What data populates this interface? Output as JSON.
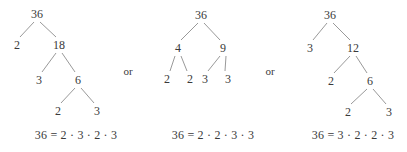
{
  "figure": {
    "subject": "36",
    "separator_label": "or",
    "separators": [
      {
        "label": "or",
        "x": 128,
        "y": 71
      },
      {
        "label": "or",
        "x": 270,
        "y": 71
      }
    ],
    "trees": [
      {
        "id": "factor-tree-1",
        "nodes": [
          {
            "id": "t1-root",
            "label": "36",
            "x": 37,
            "y": 14
          },
          {
            "id": "t1-l1a",
            "label": "2",
            "x": 17,
            "y": 45
          },
          {
            "id": "t1-l1b",
            "label": "18",
            "x": 59,
            "y": 45
          },
          {
            "id": "t1-l2a",
            "label": "3",
            "x": 39,
            "y": 80
          },
          {
            "id": "t1-l2b",
            "label": "6",
            "x": 78,
            "y": 80
          },
          {
            "id": "t1-l3a",
            "label": "2",
            "x": 58,
            "y": 111
          },
          {
            "id": "t1-l3b",
            "label": "3",
            "x": 97,
            "y": 111
          }
        ],
        "edges": [
          {
            "from": "t1-root",
            "to": "t1-l1a"
          },
          {
            "from": "t1-root",
            "to": "t1-l1b"
          },
          {
            "from": "t1-l1b",
            "to": "t1-l2a"
          },
          {
            "from": "t1-l1b",
            "to": "t1-l2b"
          },
          {
            "from": "t1-l2b",
            "to": "t1-l3a"
          },
          {
            "from": "t1-l2b",
            "to": "t1-l3b"
          }
        ],
        "equation": {
          "text": "36 = 2 · 3 · 2 · 3",
          "x": 76,
          "y": 135
        }
      },
      {
        "id": "factor-tree-2",
        "nodes": [
          {
            "id": "t2-root",
            "label": "36",
            "x": 201,
            "y": 15
          },
          {
            "id": "t2-l1a",
            "label": "4",
            "x": 178,
            "y": 48
          },
          {
            "id": "t2-l1b",
            "label": "9",
            "x": 223,
            "y": 48
          },
          {
            "id": "t2-l2a",
            "label": "2",
            "x": 167,
            "y": 79
          },
          {
            "id": "t2-l2b",
            "label": "2",
            "x": 190,
            "y": 79
          },
          {
            "id": "t2-l2c",
            "label": "3",
            "x": 205,
            "y": 79
          },
          {
            "id": "t2-l2d",
            "label": "3",
            "x": 228,
            "y": 79
          }
        ],
        "edges": [
          {
            "from": "t2-root",
            "to": "t2-l1a"
          },
          {
            "from": "t2-root",
            "to": "t2-l1b"
          },
          {
            "from": "t2-l1a",
            "to": "t2-l2a"
          },
          {
            "from": "t2-l1a",
            "to": "t2-l2b"
          },
          {
            "from": "t2-l1b",
            "to": "t2-l2c"
          },
          {
            "from": "t2-l1b",
            "to": "t2-l2d"
          }
        ],
        "equation": {
          "text": "36 = 2 · 2 · 3 · 3",
          "x": 213,
          "y": 135
        }
      },
      {
        "id": "factor-tree-3",
        "nodes": [
          {
            "id": "t3-root",
            "label": "36",
            "x": 330,
            "y": 15
          },
          {
            "id": "t3-l1a",
            "label": "3",
            "x": 310,
            "y": 48
          },
          {
            "id": "t3-l1b",
            "label": "12",
            "x": 353,
            "y": 48
          },
          {
            "id": "t3-l2a",
            "label": "2",
            "x": 331,
            "y": 81
          },
          {
            "id": "t3-l2b",
            "label": "6",
            "x": 370,
            "y": 81
          },
          {
            "id": "t3-l3a",
            "label": "2",
            "x": 348,
            "y": 112
          },
          {
            "id": "t3-l3b",
            "label": "3",
            "x": 389,
            "y": 112
          }
        ],
        "edges": [
          {
            "from": "t3-root",
            "to": "t3-l1a"
          },
          {
            "from": "t3-root",
            "to": "t3-l1b"
          },
          {
            "from": "t3-l1b",
            "to": "t3-l2a"
          },
          {
            "from": "t3-l1b",
            "to": "t3-l2b"
          },
          {
            "from": "t3-l2b",
            "to": "t3-l3a"
          },
          {
            "from": "t3-l2b",
            "to": "t3-l3b"
          }
        ],
        "equation": {
          "text": "36 = 3 · 2 · 2 · 3",
          "x": 353,
          "y": 135
        }
      }
    ],
    "colors": {
      "text": "#3a3a3a",
      "line": "#8d8d8d",
      "background": "#ffffff"
    }
  }
}
